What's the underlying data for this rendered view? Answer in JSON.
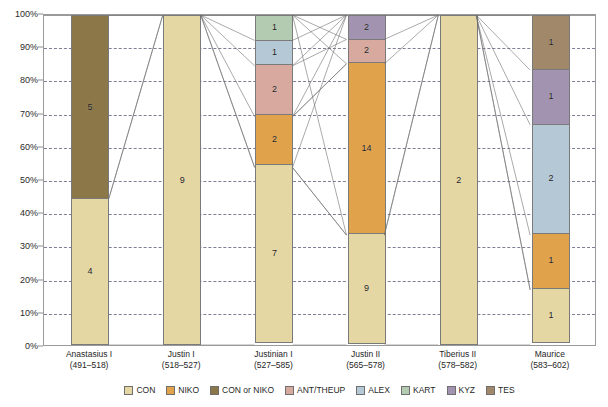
{
  "chart_data": {
    "type": "bar",
    "subtype": "stacked-percentage",
    "title": "",
    "subtitle": "",
    "xlabel": "",
    "ylabel": "",
    "ylim": [
      0,
      100
    ],
    "yunit": "%",
    "grid": true,
    "legend_position": "bottom",
    "ytick_labels": [
      "100%",
      "90%",
      "80%",
      "70%",
      "60%",
      "50%",
      "40%",
      "30%",
      "20%",
      "10%",
      "0%"
    ],
    "ytick_values": [
      100,
      90,
      80,
      70,
      60,
      50,
      40,
      30,
      20,
      10,
      0
    ],
    "categories": [
      "Anastasius I",
      "Justin I",
      "Justinian I",
      "Justin II",
      "Tiberius II",
      "Maurice"
    ],
    "category_sublabels": [
      "(491–518)",
      "(518–527)",
      "(527–585)",
      "(565–578)",
      "(578–582)",
      "(583–602)"
    ],
    "series": [
      {
        "name": "CON",
        "color": "#e5d7a3",
        "values": [
          4,
          9,
          7,
          9,
          2,
          1
        ]
      },
      {
        "name": "NIKO",
        "color": "#e0a24b",
        "values": [
          0,
          0,
          2,
          14,
          0,
          1
        ]
      },
      {
        "name": "CON or NIKO",
        "color": "#8b7747",
        "values": [
          5,
          0,
          0,
          0,
          0,
          0
        ]
      },
      {
        "name": "ANT/THEUP",
        "color": "#d7a99f",
        "values": [
          0,
          0,
          2,
          2,
          0,
          0
        ]
      },
      {
        "name": "ALEX",
        "color": "#b4c8d6",
        "values": [
          0,
          0,
          1,
          0,
          0,
          2
        ]
      },
      {
        "name": "KART",
        "color": "#b3cbb0",
        "values": [
          0,
          0,
          1,
          0,
          0,
          0
        ]
      },
      {
        "name": "KYZ",
        "color": "#a294b0",
        "values": [
          0,
          0,
          0,
          2,
          0,
          1
        ]
      },
      {
        "name": "TES",
        "color": "#a1886b",
        "values": [
          0,
          0,
          0,
          0,
          0,
          1
        ]
      }
    ],
    "stacks": [
      {
        "category": "Anastasius I",
        "total": 9,
        "segments": [
          {
            "series": "CON",
            "value": 4,
            "label": "4",
            "pct_from": 0,
            "pct_to": 44.4
          },
          {
            "series": "CON or NIKO",
            "value": 5,
            "label": "5",
            "pct_from": 44.4,
            "pct_to": 100
          }
        ]
      },
      {
        "category": "Justin I",
        "total": 9,
        "segments": [
          {
            "series": "CON",
            "value": 9,
            "label": "9",
            "pct_from": 0,
            "pct_to": 100
          }
        ]
      },
      {
        "category": "Justinian I",
        "total": 13,
        "segments": [
          {
            "series": "CON",
            "value": 7,
            "label": "7",
            "pct_from": 0,
            "pct_to": 53.8
          },
          {
            "series": "NIKO",
            "value": 2,
            "label": "2",
            "pct_from": 53.8,
            "pct_to": 69.2
          },
          {
            "series": "ANT/THEUP",
            "value": 2,
            "label": "2",
            "pct_from": 69.2,
            "pct_to": 84.6
          },
          {
            "series": "ALEX",
            "value": 1,
            "label": "1",
            "pct_from": 84.6,
            "pct_to": 92.3
          },
          {
            "series": "KART",
            "value": 1,
            "label": "1",
            "pct_from": 92.3,
            "pct_to": 100
          }
        ]
      },
      {
        "category": "Justin II",
        "total": 27,
        "segments": [
          {
            "series": "CON",
            "value": 9,
            "label": "9",
            "pct_from": 0,
            "pct_to": 33.3
          },
          {
            "series": "NIKO",
            "value": 14,
            "label": "14",
            "pct_from": 33.3,
            "pct_to": 85.2
          },
          {
            "series": "ANT/THEUP",
            "value": 2,
            "label": "2",
            "pct_from": 85.2,
            "pct_to": 92.6
          },
          {
            "series": "KYZ",
            "value": 2,
            "label": "2",
            "pct_from": 92.6,
            "pct_to": 100
          }
        ]
      },
      {
        "category": "Tiberius II",
        "total": 2,
        "segments": [
          {
            "series": "CON",
            "value": 2,
            "label": "2",
            "pct_from": 0,
            "pct_to": 100
          }
        ]
      },
      {
        "category": "Maurice",
        "total": 6,
        "segments": [
          {
            "series": "CON",
            "value": 1,
            "label": "1",
            "pct_from": 0,
            "pct_to": 16.7
          },
          {
            "series": "NIKO",
            "value": 1,
            "label": "1",
            "pct_from": 16.7,
            "pct_to": 33.3
          },
          {
            "series": "ALEX",
            "value": 2,
            "label": "2",
            "pct_from": 33.3,
            "pct_to": 66.7
          },
          {
            "series": "KYZ",
            "value": 1,
            "label": "1",
            "pct_from": 66.7,
            "pct_to": 83.3
          },
          {
            "series": "TES",
            "value": 1,
            "label": "1",
            "pct_from": 83.3,
            "pct_to": 100
          }
        ]
      }
    ],
    "legend": [
      {
        "label": "CON",
        "color": "#e5d7a3"
      },
      {
        "label": "NIKO",
        "color": "#e0a24b"
      },
      {
        "label": "CON or NIKO",
        "color": "#8b7747"
      },
      {
        "label": "ANT/THEUP",
        "color": "#d7a99f"
      },
      {
        "label": "ALEX",
        "color": "#b4c8d6"
      },
      {
        "label": "KART",
        "color": "#b3cbb0"
      },
      {
        "label": "KYZ",
        "color": "#a294b0"
      },
      {
        "label": "TES",
        "color": "#a1886b"
      }
    ],
    "annotations": "Thin grey connector lines link segment boundaries of adjacent bars, tracing mint continuity between reigns."
  },
  "colors": {
    "frame": "#9a9a9a",
    "gridline": "#7d7f96",
    "connector": "#6f6f6f",
    "text": "#1f1f1f",
    "background": "#ffffff"
  }
}
